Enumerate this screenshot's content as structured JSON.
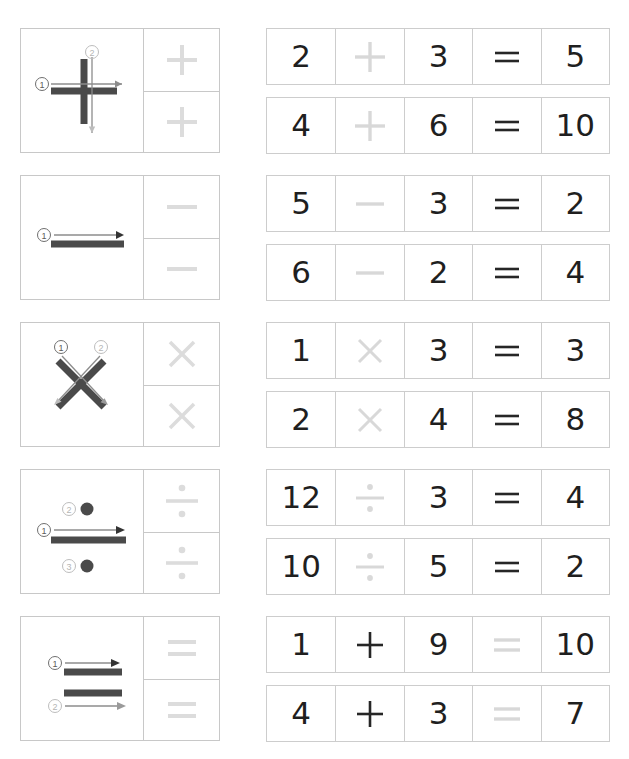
{
  "worksheet": {
    "title": "Math Symbols Stroke Order and Equation Tracing Worksheet",
    "colors": {
      "border": "#c8c8c8",
      "eq_border": "#cdcdcd",
      "dark_ink": "#1f1f1f",
      "trace_gray": "#d8d8d8",
      "stroke_gray": "#4a4a4a",
      "arrow_gray": "#8c8c8c"
    },
    "rows": [
      {
        "symbol_name": "plus-sign",
        "symbol_glyph": "+",
        "stroke_count": 2,
        "stroke_labels": [
          "1",
          "2"
        ],
        "stroke_directions": [
          "left-to-right",
          "top-to-bottom"
        ],
        "trace_cells": [
          "+",
          "+"
        ],
        "equations": [
          {
            "cells": [
              "2",
              "+",
              "3",
              "=",
              "5"
            ],
            "traced_index": 1,
            "left": "2",
            "operator": "+",
            "right": "3",
            "equals": "=",
            "result": "5"
          },
          {
            "cells": [
              "4",
              "+",
              "6",
              "=",
              "10"
            ],
            "traced_index": 1,
            "left": "4",
            "operator": "+",
            "right": "6",
            "equals": "=",
            "result": "10"
          }
        ]
      },
      {
        "symbol_name": "minus-sign",
        "symbol_glyph": "−",
        "stroke_count": 1,
        "stroke_labels": [
          "1"
        ],
        "stroke_directions": [
          "left-to-right"
        ],
        "trace_cells": [
          "−",
          "−"
        ],
        "equations": [
          {
            "cells": [
              "5",
              "−",
              "3",
              "=",
              "2"
            ],
            "traced_index": 1,
            "left": "5",
            "operator": "−",
            "right": "3",
            "equals": "=",
            "result": "2"
          },
          {
            "cells": [
              "6",
              "−",
              "2",
              "=",
              "4"
            ],
            "traced_index": 1,
            "left": "6",
            "operator": "−",
            "right": "2",
            "equals": "=",
            "result": "4"
          }
        ]
      },
      {
        "symbol_name": "multiplication-sign",
        "symbol_glyph": "×",
        "stroke_count": 2,
        "stroke_labels": [
          "1",
          "2"
        ],
        "stroke_directions": [
          "top-left-to-bottom-right",
          "top-right-to-bottom-left"
        ],
        "trace_cells": [
          "×",
          "×"
        ],
        "equations": [
          {
            "cells": [
              "1",
              "×",
              "3",
              "=",
              "3"
            ],
            "traced_index": 1,
            "left": "1",
            "operator": "×",
            "right": "3",
            "equals": "=",
            "result": "3"
          },
          {
            "cells": [
              "2",
              "×",
              "4",
              "=",
              "8"
            ],
            "traced_index": 1,
            "left": "2",
            "operator": "×",
            "right": "4",
            "equals": "=",
            "result": "8"
          }
        ]
      },
      {
        "symbol_name": "division-sign",
        "symbol_glyph": "÷",
        "stroke_count": 3,
        "stroke_labels": [
          "1",
          "2",
          "3"
        ],
        "stroke_directions": [
          "left-to-right",
          "dot-above",
          "dot-below"
        ],
        "trace_cells": [
          "÷",
          "÷"
        ],
        "equations": [
          {
            "cells": [
              "12",
              "÷",
              "3",
              "=",
              "4"
            ],
            "traced_index": 1,
            "left": "12",
            "operator": "÷",
            "right": "3",
            "equals": "=",
            "result": "4"
          },
          {
            "cells": [
              "10",
              "÷",
              "5",
              "=",
              "2"
            ],
            "traced_index": 1,
            "left": "10",
            "operator": "÷",
            "right": "5",
            "equals": "=",
            "result": "2"
          }
        ]
      },
      {
        "symbol_name": "equals-sign",
        "symbol_glyph": "=",
        "stroke_count": 2,
        "stroke_labels": [
          "1",
          "2"
        ],
        "stroke_directions": [
          "left-to-right",
          "left-to-right"
        ],
        "trace_cells": [
          "=",
          "="
        ],
        "equations": [
          {
            "cells": [
              "1",
              "+",
              "9",
              "=",
              "10"
            ],
            "traced_index": 3,
            "left": "1",
            "operator": "+",
            "right": "9",
            "equals": "=",
            "result": "10"
          },
          {
            "cells": [
              "4",
              "+",
              "3",
              "=",
              "7"
            ],
            "traced_index": 3,
            "left": "4",
            "operator": "+",
            "right": "3",
            "equals": "=",
            "result": "7"
          }
        ]
      }
    ]
  }
}
